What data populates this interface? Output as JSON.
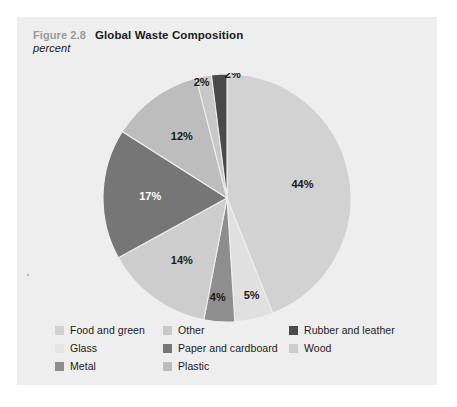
{
  "figure": {
    "number": "Figure 2.8",
    "title": "Global Waste Composition",
    "subtitle": "percent"
  },
  "chart_data": {
    "type": "pie",
    "title": "Global Waste Composition",
    "subtitle": "percent",
    "unit": "percent",
    "xlabel": "",
    "ylabel": "",
    "legend_position": "bottom",
    "grid": false,
    "start_angle_deg": 0,
    "direction": "clockwise",
    "categories": [
      "Food and green",
      "Glass",
      "Metal",
      "Other",
      "Paper and cardboard",
      "Plastic",
      "Rubber and leather",
      "Wood"
    ],
    "values": [
      44,
      5,
      4,
      2,
      17,
      12,
      2,
      14
    ],
    "colors": [
      "#d2d2d2",
      "#e0e0e0",
      "#8e8e8e",
      "#c8c8c8",
      "#767676",
      "#bdbdbd",
      "#4a4a4a",
      "#cdcdcd"
    ],
    "slices": [
      {
        "label": "Food and green",
        "value": 44,
        "display": "44%",
        "color": "#d2d2d2",
        "label_color": "#1a1a1a"
      },
      {
        "label": "Glass",
        "value": 5,
        "display": "5%",
        "color": "#e0e0e0",
        "label_color": "#1a1a1a"
      },
      {
        "label": "Metal",
        "value": 4,
        "display": "4%",
        "color": "#8e8e8e",
        "label_color": "#1a1a1a"
      },
      {
        "label": "Wood",
        "value": 14,
        "display": "14%",
        "color": "#cdcdcd",
        "label_color": "#1a1a1a"
      },
      {
        "label": "Paper and cardboard",
        "value": 17,
        "display": "17%",
        "color": "#767676",
        "label_color": "#ffffff"
      },
      {
        "label": "Plastic",
        "value": 12,
        "display": "12%",
        "color": "#bdbdbd",
        "label_color": "#1a1a1a"
      },
      {
        "label": "Other",
        "value": 2,
        "display": "2%",
        "color": "#c8c8c8",
        "label_color": "#1a1a1a"
      },
      {
        "label": "Rubber and leather",
        "value": 2,
        "display": "2%",
        "color": "#4a4a4a",
        "label_color": "#1a1a1a"
      }
    ],
    "data_labels": [
      "44%",
      "5%",
      "4%",
      "14%",
      "17%",
      "12%",
      "2%",
      "2%"
    ]
  },
  "legend": {
    "columns": [
      {
        "items": [
          {
            "label": "Food and green",
            "color": "#d2d2d2"
          },
          {
            "label": "Glass",
            "color": "#e4e4e4"
          },
          {
            "label": "Metal",
            "color": "#8e8e8e"
          }
        ]
      },
      {
        "items": [
          {
            "label": "Other",
            "color": "#c8c8c8"
          },
          {
            "label": "Paper and cardboard",
            "color": "#767676"
          },
          {
            "label": "Plastic",
            "color": "#bdbdbd"
          }
        ]
      },
      {
        "items": [
          {
            "label": "Rubber and leather",
            "color": "#4a4a4a"
          },
          {
            "label": "Wood",
            "color": "#cdcdcd"
          }
        ]
      }
    ]
  }
}
